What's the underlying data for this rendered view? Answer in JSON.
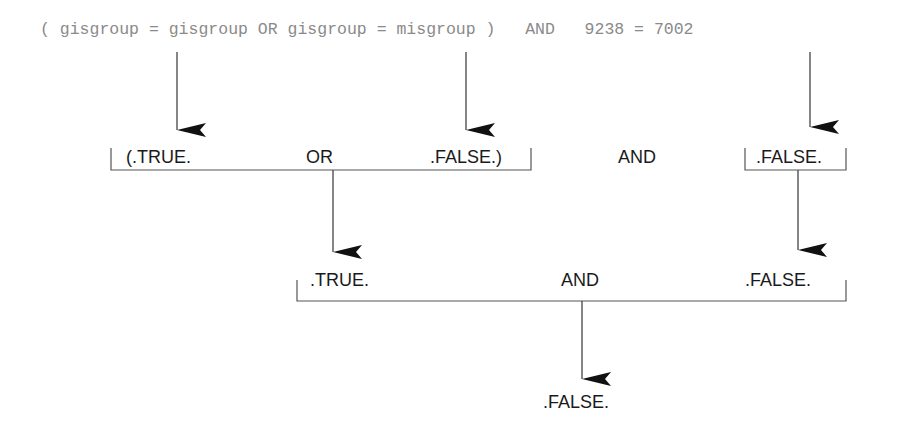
{
  "expression": {
    "text": "( gisgroup = gisgroup OR gisgroup = misgroup )   AND   9238 = 7002"
  },
  "step1": {
    "left_group": {
      "open": "(.TRUE.",
      "operator": "OR",
      "close": ".FALSE.)"
    },
    "operator": "AND",
    "right_value": ".FALSE."
  },
  "step2": {
    "left_value": ".TRUE.",
    "operator": "AND",
    "right_value": ".FALSE."
  },
  "result": {
    "value": ".FALSE."
  },
  "colors": {
    "expression_text": "#8a8a8a",
    "label_text": "#1a1a1a",
    "lines": "#555555",
    "arrows": "#111111"
  }
}
